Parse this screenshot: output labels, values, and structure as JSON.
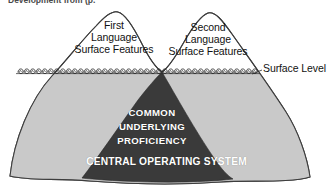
{
  "figure": {
    "caption_partial": "Development from (p.",
    "surface_level_label": "Surface Level",
    "peaks": [
      {
        "id": "first-language",
        "line1": "First",
        "line2": "Language",
        "line3": "Surface Features"
      },
      {
        "id": "second-language",
        "line1": "Second",
        "line2": "Language",
        "line3": "Surface Features"
      }
    ],
    "core": {
      "line1": "COMMON",
      "line2": "UNDERLYING",
      "line3": "PROFICIENCY",
      "subtitle": "CENTRAL OPERATING SYSTEM"
    },
    "colors": {
      "mountain_fill": "#c9c9c9",
      "mountain_stroke": "#3d3d3d",
      "core_fill": "#3a3a3a",
      "core_text": "#ffffff",
      "background": "#ffffff",
      "label_text": "#111111"
    }
  }
}
